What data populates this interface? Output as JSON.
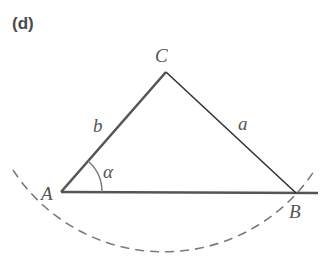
{
  "panel": {
    "label": "(d)"
  },
  "figure": {
    "type": "triangle-ambiguous-case",
    "vertices": {
      "A": {
        "label": "A",
        "x": 61,
        "y": 192
      },
      "B": {
        "label": "B",
        "x": 296,
        "y": 193
      },
      "C": {
        "label": "C",
        "x": 166,
        "y": 72
      }
    },
    "sides": {
      "a": {
        "label": "a",
        "from": "C",
        "to": "B"
      },
      "b": {
        "label": "b",
        "from": "A",
        "to": "C"
      }
    },
    "angle": {
      "label": "α",
      "vertex": "A"
    },
    "arc": {
      "style": "dashed",
      "center": "C",
      "through": "B"
    },
    "colors": {
      "side_b": "#555555",
      "side_a": "#333333",
      "baseline": "#555555",
      "arc": "#777777",
      "labels": "#555555"
    }
  }
}
